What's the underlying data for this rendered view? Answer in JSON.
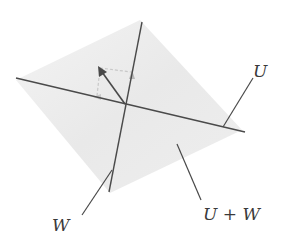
{
  "diagram": {
    "type": "subspace-sum",
    "labels": {
      "u": "U",
      "w": "W",
      "sum": "U + W"
    },
    "colors": {
      "plane": "#ececec",
      "line": "#4a4a4a",
      "dashed": "#c4c4c4",
      "label": "#3a3a3a"
    }
  }
}
